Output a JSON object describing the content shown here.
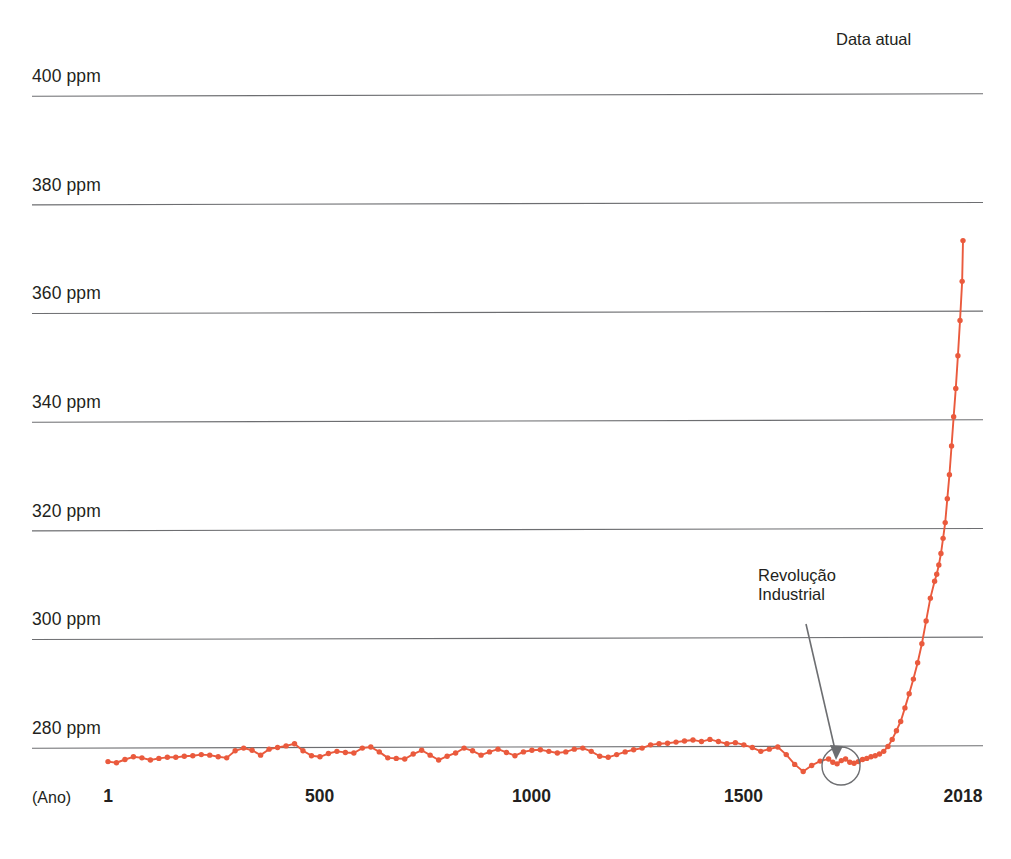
{
  "header": {
    "clipped_top_text": "· · ···· ··",
    "caption_x": "(Ano)"
  },
  "annotations": {
    "current_data": "Data atual",
    "industrial_revolution": "Revolução\nIndustrial"
  },
  "colors": {
    "series": "#ea5a3d",
    "gridline": "#6d6e71",
    "annotation_line": "#6d6e71",
    "text": "#231f20",
    "background": "#ffffff"
  },
  "chart_data": {
    "type": "line",
    "title": "",
    "subtitle": "",
    "xlabel": "(Ano)",
    "ylabel": "",
    "unit": "ppm",
    "grid": true,
    "legend": "none",
    "marker": "circle",
    "xlim": [
      1,
      2018
    ],
    "ylim": [
      272,
      412
    ],
    "xticks": [
      1,
      500,
      1000,
      1500,
      2018
    ],
    "xticklabels": [
      "1",
      "500",
      "1000",
      "1500",
      "2018"
    ],
    "yticks": [
      280,
      300,
      320,
      340,
      360,
      380,
      400
    ],
    "yticklabels": [
      "280 ppm",
      "300 ppm",
      "320 ppm",
      "340 ppm",
      "360 ppm",
      "380 ppm",
      "400 ppm"
    ],
    "series_name": "CO2 atmosférico",
    "x": [
      1,
      21,
      41,
      61,
      81,
      101,
      121,
      141,
      161,
      181,
      201,
      221,
      241,
      261,
      281,
      301,
      321,
      341,
      361,
      381,
      401,
      421,
      441,
      461,
      481,
      501,
      521,
      541,
      561,
      581,
      601,
      621,
      641,
      661,
      681,
      701,
      721,
      741,
      761,
      781,
      801,
      821,
      841,
      861,
      881,
      901,
      921,
      941,
      961,
      981,
      1001,
      1021,
      1041,
      1061,
      1081,
      1101,
      1121,
      1141,
      1161,
      1181,
      1201,
      1221,
      1241,
      1261,
      1281,
      1301,
      1321,
      1341,
      1361,
      1381,
      1401,
      1421,
      1441,
      1461,
      1481,
      1501,
      1521,
      1541,
      1561,
      1581,
      1601,
      1621,
      1641,
      1661,
      1681,
      1701,
      1711,
      1721,
      1731,
      1741,
      1751,
      1761,
      1771,
      1781,
      1791,
      1801,
      1811,
      1821,
      1831,
      1841,
      1851,
      1861,
      1871,
      1881,
      1891,
      1901,
      1911,
      1921,
      1931,
      1941,
      1951,
      1956,
      1961,
      1966,
      1971,
      1976,
      1981,
      1986,
      1991,
      1996,
      2001,
      2006,
      2011,
      2016,
      2018
    ],
    "y": [
      277.3,
      277.1,
      277.7,
      278.2,
      278.0,
      277.6,
      277.9,
      278.1,
      278.1,
      278.3,
      278.4,
      278.6,
      278.5,
      278.2,
      278.0,
      279.3,
      279.8,
      279.4,
      278.5,
      279.6,
      279.9,
      280.2,
      280.6,
      279.3,
      278.4,
      278.2,
      278.8,
      279.2,
      279.0,
      278.9,
      279.8,
      280.0,
      279.1,
      278.0,
      277.9,
      277.8,
      278.7,
      279.4,
      278.5,
      277.6,
      278.3,
      278.9,
      279.8,
      279.3,
      278.5,
      279.1,
      279.6,
      279.0,
      278.4,
      279.1,
      279.4,
      279.5,
      279.2,
      278.9,
      279.1,
      279.6,
      279.8,
      279.2,
      278.3,
      278.1,
      278.6,
      279.1,
      279.5,
      279.8,
      280.4,
      280.6,
      280.7,
      280.9,
      281.1,
      281.3,
      281.0,
      281.4,
      281.0,
      280.6,
      280.8,
      280.4,
      279.9,
      279.2,
      279.6,
      280.0,
      278.6,
      276.8,
      275.5,
      276.6,
      277.4,
      277.8,
      277.2,
      276.9,
      277.5,
      277.8,
      277.2,
      277.0,
      277.3,
      277.7,
      277.9,
      278.2,
      278.4,
      278.7,
      279.2,
      280.1,
      281.4,
      283.0,
      284.7,
      287.2,
      289.8,
      292.5,
      295.5,
      299.0,
      303.2,
      307.4,
      310.5,
      311.8,
      313.5,
      315.6,
      318.4,
      321.3,
      325.7,
      330.1,
      335.4,
      340.8,
      346.0,
      352.0,
      358.5,
      365.7,
      373.2,
      381.3,
      390.0,
      400.8,
      408.0
    ]
  }
}
